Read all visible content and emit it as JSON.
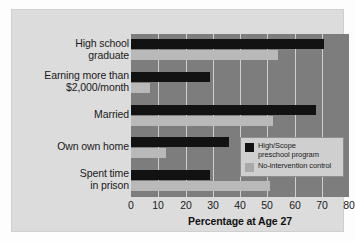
{
  "chart_data": {
    "type": "bar",
    "orientation": "horizontal",
    "title": "",
    "xlabel": "Percentage at Age 27",
    "ylabel": "",
    "xlim": [
      0,
      80
    ],
    "xticks": [
      0,
      10,
      20,
      30,
      40,
      50,
      60,
      70,
      80
    ],
    "xtick_labels": [
      "0",
      "10",
      "20",
      "30",
      "40",
      "50",
      "60",
      "70",
      "80"
    ],
    "grid": true,
    "grid_axis": "x",
    "legend_position": "lower-right-inside",
    "categories": [
      "High school graduate",
      "Earning more than $2,000/month",
      "Married",
      "Own own home",
      "Spent time in prison"
    ],
    "category_lines": [
      [
        "High school",
        "graduate"
      ],
      [
        "Earning more than",
        "$2,000/month"
      ],
      [
        "Married"
      ],
      [
        "Own own home"
      ],
      [
        "Spent time",
        "in prison"
      ]
    ],
    "series": [
      {
        "name": "High/Scope preschool program",
        "name_lines": [
          "High/Scope",
          "preschool program"
        ],
        "color": "#121212",
        "values": [
          71,
          29,
          68,
          36,
          29
        ]
      },
      {
        "name": "No-intervention control",
        "name_lines": [
          "No-intervention control"
        ],
        "color": "#b9b9b9",
        "values": [
          54,
          7,
          52,
          13,
          51
        ]
      }
    ],
    "colors": {
      "plot_background": "#7d7d7d",
      "panel_background": "#dcdcdc",
      "gridline": "#cfcfcf",
      "series_dark": "#121212",
      "series_light": "#b9b9b9",
      "legend_background": "#cfcfcf",
      "text": "#1a1a1a"
    }
  }
}
